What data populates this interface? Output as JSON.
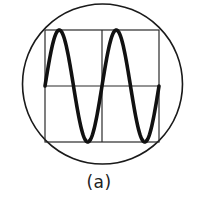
{
  "figure": {
    "caption": "(a)",
    "screen": {
      "cx": 102.5,
      "cy": 84,
      "r": 80,
      "stroke": "#1a1a1a"
    },
    "grid": {
      "x0": 45,
      "x1": 159,
      "y0": 30,
      "y1": 142,
      "divisions_x": 2,
      "divisions_y": 2,
      "stroke": "#2a2a2a"
    },
    "wave": {
      "type": "sine",
      "periods": 2,
      "phase": "starts at zero crossing rising",
      "stroke": "#111111",
      "stroke_width": 3.6
    }
  }
}
